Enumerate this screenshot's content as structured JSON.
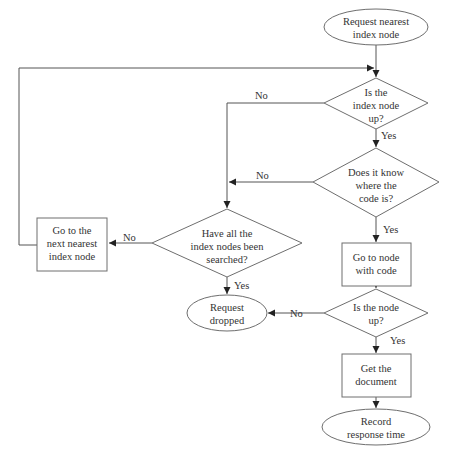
{
  "flowchart": {
    "nodes": {
      "start": {
        "type": "terminal",
        "lines": [
          "Request nearest",
          "index node"
        ]
      },
      "d_index_up": {
        "type": "decision",
        "lines": [
          "Is the",
          "index node",
          "up?"
        ]
      },
      "d_know_code": {
        "type": "decision",
        "lines": [
          "Does it know",
          "where the",
          "code is?"
        ]
      },
      "p_go_code": {
        "type": "process",
        "lines": [
          "Go to node",
          "with code"
        ]
      },
      "d_node_up": {
        "type": "decision",
        "lines": [
          "Is the node",
          "up?"
        ]
      },
      "p_get_doc": {
        "type": "process",
        "lines": [
          "Get the",
          "document"
        ]
      },
      "end_record": {
        "type": "terminal",
        "lines": [
          "Record",
          "response time"
        ]
      },
      "d_all_searched": {
        "type": "decision",
        "lines": [
          "Have all the",
          "index nodes been",
          "searched?"
        ]
      },
      "p_next_index": {
        "type": "process",
        "lines": [
          "Go to the",
          "next nearest",
          "index node"
        ]
      },
      "end_dropped": {
        "type": "terminal",
        "lines": [
          "Request",
          "dropped"
        ]
      }
    },
    "edges": {
      "index_up_no": "No",
      "index_up_yes": "Yes",
      "know_code_no": "No",
      "know_code_yes": "Yes",
      "node_up_no": "No",
      "node_up_yes": "Yes",
      "all_searched_no": "No",
      "all_searched_yes": "Yes"
    }
  },
  "colors": {
    "stroke": "#6e6e6e",
    "text": "#333333",
    "background": "#ffffff"
  }
}
